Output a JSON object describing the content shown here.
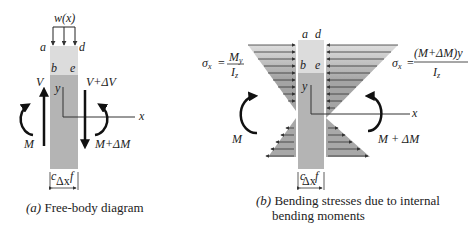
{
  "panel_a": {
    "load_label": "w(x)",
    "corners": {
      "a": "a",
      "b": "b",
      "c": "c",
      "d": "d",
      "e": "e",
      "f": "f"
    },
    "shear_left": "V",
    "shear_right": "V+ΔV",
    "moment_left": "M",
    "moment_right": "M+ΔM",
    "axis_y": "y",
    "axis_x": "x",
    "width_label": "Δx",
    "caption_prefix": "(a)",
    "caption": "Free-body diagram"
  },
  "panel_b": {
    "corners": {
      "a": "a",
      "b": "b",
      "c": "c",
      "d": "d",
      "e": "e",
      "f": "f"
    },
    "formula_left": {
      "lhs": "σ",
      "lhs_sub": "x",
      "eq": "=",
      "num": "M",
      "num_sub": "y",
      "den": "I",
      "den_sub": "z"
    },
    "formula_right": {
      "lhs": "σ",
      "lhs_sub": "x",
      "eq": "=",
      "num": "(M+ΔM)y",
      "den": "I",
      "den_sub": "z"
    },
    "moment_left": "M",
    "moment_right": "M + ΔM",
    "axis_y": "y",
    "axis_x": "x",
    "width_label": "Δx",
    "caption_prefix": "(b)",
    "caption_line1": "Bending stresses due to internal",
    "caption_line2": "bending moments"
  },
  "colors": {
    "element_light": "#dcdcdc",
    "element_dark": "#b4b4b4",
    "stress_light": "#d8d8d8",
    "stress_dark": "#a8a8a8",
    "ink": "#222222"
  }
}
